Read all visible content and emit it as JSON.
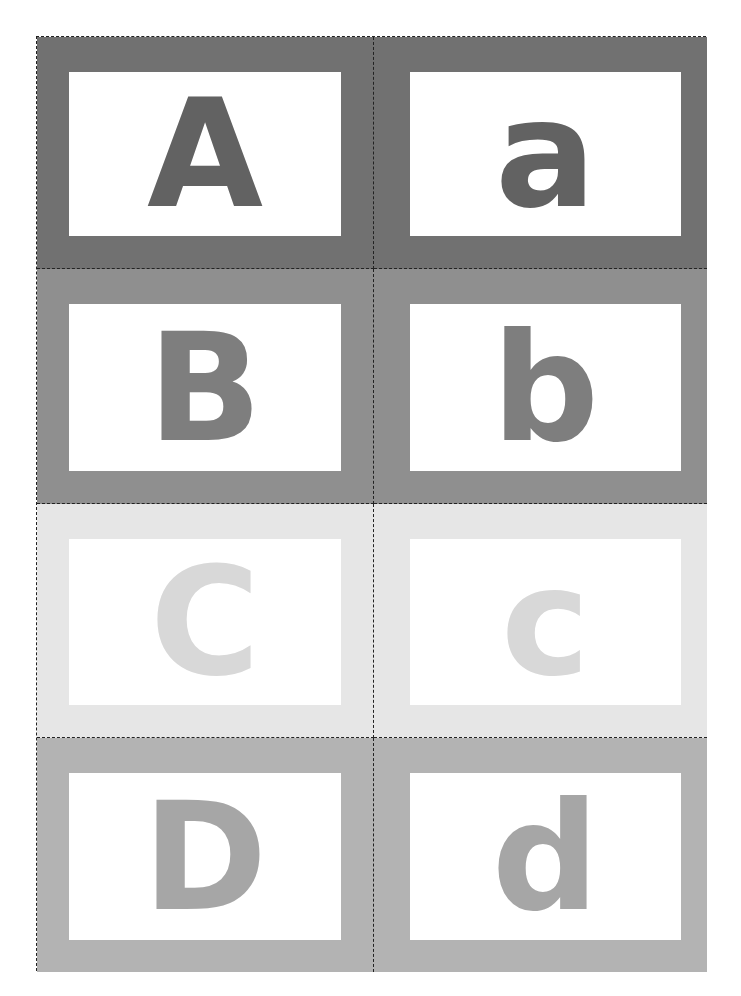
{
  "sheet": {
    "title": "Alphabet flash cards",
    "rows": [
      {
        "upper": "A",
        "lower": "a",
        "band_color": "#717171",
        "letter_color": "#626262"
      },
      {
        "upper": "B",
        "lower": "b",
        "band_color": "#8f8f8f",
        "letter_color": "#7e7e7e"
      },
      {
        "upper": "C",
        "lower": "c",
        "band_color": "#e6e6e6",
        "letter_color": "#d8d8d8"
      },
      {
        "upper": "D",
        "lower": "d",
        "band_color": "#b3b3b3",
        "letter_color": "#a6a6a6"
      }
    ]
  }
}
